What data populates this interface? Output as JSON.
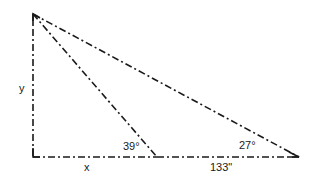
{
  "diagram": {
    "type": "right-triangle-geometry",
    "points": {
      "top": {
        "x": 33,
        "y": 14
      },
      "right_angle": {
        "x": 33,
        "y": 157
      },
      "mid_base": {
        "x": 157,
        "y": 157
      },
      "right": {
        "x": 299,
        "y": 157
      }
    },
    "labels": {
      "y": "y",
      "x": "x",
      "angle_mid": "39°",
      "angle_right": "27°",
      "base_segment": "133\""
    },
    "segments": [
      {
        "name": "vertical-side-y",
        "from": "top",
        "to": "right_angle"
      },
      {
        "name": "base-x",
        "from": "right_angle",
        "to": "mid_base"
      },
      {
        "name": "base-133",
        "from": "mid_base",
        "to": "right"
      },
      {
        "name": "inner-diagonal",
        "from": "top",
        "to": "mid_base"
      },
      {
        "name": "hypotenuse",
        "from": "top",
        "to": "right"
      }
    ],
    "colors": {
      "line": "#1a1a1a",
      "background": "#ffffff"
    }
  }
}
